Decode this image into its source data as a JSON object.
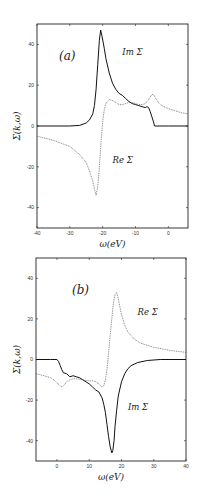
{
  "chart_data": [
    {
      "type": "line",
      "panel_label": "(a)",
      "xlabel": "ω(eV)",
      "ylabel": "Σ(k,ω)",
      "xlim": [
        -40,
        6
      ],
      "ylim": [
        -50,
        50
      ],
      "xticks": [
        -40,
        -30,
        -20,
        -10,
        0
      ],
      "yticks": [
        -40,
        -20,
        0,
        20,
        40
      ],
      "grid": false,
      "annotations": [
        {
          "text": "Im Σ",
          "x": -14,
          "y": 35
        },
        {
          "text": "Re Σ",
          "x": -17,
          "y": -18
        }
      ],
      "series": [
        {
          "name": "Im Σ",
          "style": "solid",
          "x": [
            -40,
            -30,
            -27,
            -25,
            -24,
            -23,
            -22.5,
            -22,
            -21.5,
            -21,
            -20.6,
            -20.2,
            -19.5,
            -19,
            -18,
            -17,
            -16,
            -15,
            -14,
            -13,
            -12,
            -11,
            -10,
            -9,
            -8,
            -7,
            -6.5,
            -6,
            -5.5,
            -5,
            -4.5,
            -4.2,
            0,
            6
          ],
          "y": [
            0,
            0,
            0.3,
            1.5,
            3,
            6,
            10,
            18,
            30,
            42,
            47,
            44,
            38,
            33,
            26,
            21,
            18,
            16,
            15,
            13.5,
            12,
            11,
            10.5,
            10,
            9.5,
            9,
            9.5,
            9,
            7,
            4.5,
            2,
            0,
            0,
            0
          ]
        },
        {
          "name": "Re Σ",
          "style": "dotted",
          "x": [
            -40,
            -35,
            -30,
            -27,
            -25,
            -24,
            -23,
            -22.5,
            -22,
            -21.5,
            -21,
            -20.5,
            -20,
            -19.5,
            -19,
            -18,
            -17,
            -16,
            -15,
            -14,
            -13,
            -12,
            -11,
            -10,
            -9,
            -8,
            -7,
            -6,
            -5,
            -4.5,
            -4,
            -3,
            -2,
            0,
            2,
            4,
            6
          ],
          "y": [
            -5,
            -7,
            -10,
            -14,
            -18,
            -22,
            -27,
            -31,
            -34,
            -30,
            -20,
            -8,
            2,
            8,
            11,
            13,
            12.5,
            11.5,
            10.5,
            10.5,
            11,
            11.5,
            11.5,
            11,
            10.5,
            10.5,
            11,
            13,
            15.5,
            15.5,
            14,
            11.5,
            10,
            8.5,
            7.5,
            6.5,
            6
          ]
        }
      ]
    },
    {
      "type": "line",
      "panel_label": "(b)",
      "xlabel": "ω(eV)",
      "ylabel": "Σ(k,ω)",
      "xlim": [
        -6.5,
        40
      ],
      "ylim": [
        -50,
        50
      ],
      "xticks": [
        0,
        10,
        20,
        30,
        40
      ],
      "yticks": [
        -40,
        -20,
        0,
        20,
        40
      ],
      "grid": false,
      "annotations": [
        {
          "text": "Re Σ",
          "x": 25,
          "y": 22
        },
        {
          "text": "Im Σ",
          "x": 22,
          "y": -25
        }
      ],
      "series": [
        {
          "name": "Im Σ",
          "style": "solid",
          "x": [
            -6.5,
            -2,
            0,
            0.5,
            1,
            1.5,
            2,
            3,
            4,
            5,
            6,
            7,
            8,
            9,
            10,
            11,
            12,
            13,
            14,
            14.5,
            15,
            15.5,
            16,
            16.5,
            17,
            17.3,
            17.7,
            18,
            18.5,
            19,
            20,
            21,
            22,
            23,
            25,
            28,
            32,
            40
          ],
          "y": [
            0,
            0,
            0,
            -1,
            -3,
            -5,
            -6.5,
            -7,
            -8.5,
            -8,
            -8.5,
            -9,
            -10,
            -11,
            -12,
            -13.5,
            -15,
            -16,
            -19,
            -22,
            -26,
            -32,
            -38,
            -43,
            -46,
            -45,
            -40,
            -33,
            -25,
            -18,
            -11,
            -7,
            -4.5,
            -3,
            -1.5,
            -0.5,
            0,
            0
          ]
        },
        {
          "name": "Re Σ",
          "style": "dotted",
          "x": [
            -6.5,
            -4,
            -2,
            -1,
            0,
            1,
            1.5,
            2,
            3,
            4,
            5,
            6,
            8,
            10,
            11,
            12,
            13,
            14,
            14.5,
            15,
            15.5,
            16,
            16.5,
            17,
            17.5,
            18,
            18.5,
            19,
            19.5,
            20,
            21,
            22,
            24,
            26,
            30,
            35,
            40
          ],
          "y": [
            -7,
            -8,
            -9,
            -10,
            -11.5,
            -13,
            -13.5,
            -13,
            -11,
            -10,
            -9.5,
            -9.5,
            -10,
            -10.5,
            -10.5,
            -11,
            -12,
            -13.5,
            -13,
            -10,
            -5,
            3,
            12,
            20,
            28,
            32,
            33,
            30,
            26,
            22,
            17,
            13.5,
            10,
            8,
            6,
            4.5,
            3.5
          ]
        }
      ]
    }
  ]
}
